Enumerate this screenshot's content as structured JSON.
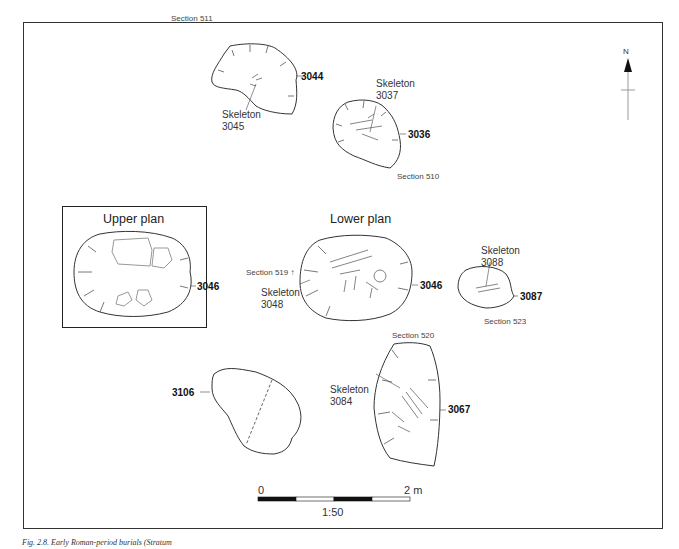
{
  "figure": {
    "caption": "Fig. 2.8. Early Roman-period burials (Stratum"
  },
  "north_arrow": {
    "label": "N"
  },
  "features": {
    "f3044": {
      "id": "3044",
      "section": "Section 511",
      "skeleton_label": "Skeleton",
      "skeleton_id": "3045"
    },
    "f3036": {
      "id": "3036",
      "section": "Section 510",
      "skeleton_label": "Skeleton",
      "skeleton_id": "3037"
    },
    "upper_plan": {
      "title": "Upper plan",
      "id": "3046"
    },
    "lower_plan": {
      "title": "Lower plan",
      "id": "3046",
      "section": "Section 519",
      "skeleton_label": "Skeleton",
      "skeleton_id": "3048"
    },
    "f3087": {
      "id": "3087",
      "section": "Section 523",
      "skeleton_label": "Skeleton",
      "skeleton_id": "3088"
    },
    "f3067": {
      "id": "3067",
      "section": "Section 520",
      "skeleton_label": "Skeleton",
      "skeleton_id": "3084"
    },
    "f3106": {
      "id": "3106"
    }
  },
  "scale_bar": {
    "start_label": "0",
    "end_label": "2 m",
    "ratio": "1:50",
    "segments": 4
  }
}
